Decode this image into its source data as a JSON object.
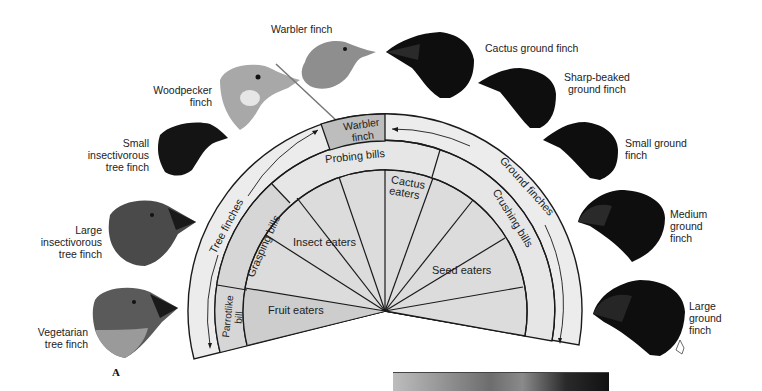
{
  "figure": {
    "panel_label": "A",
    "diagram": {
      "outer_band": {
        "left_label": "Tree finches",
        "right_label": "Ground finches",
        "center_box": "Warbler finch"
      },
      "bill_band": {
        "segments": [
          "Parrotlike bill",
          "Grasping bills",
          "Probing bills",
          "Crushing bills"
        ],
        "parrotlike_line1": "Parrotlike",
        "parrotlike_line2": "bill"
      },
      "diet_band": {
        "segments": [
          "Fruit eaters",
          "Insect eaters",
          "Cactus eaters",
          "Seed eaters"
        ],
        "cactus_line1": "Cactus",
        "cactus_line2": "eaters"
      }
    },
    "birds_left": [
      {
        "name": "Vegetarian tree finch",
        "lines": [
          "Vegetarian",
          "tree finch"
        ]
      },
      {
        "name": "Large insectivorous tree finch",
        "lines": [
          "Large",
          "insectivorous",
          "tree finch"
        ]
      },
      {
        "name": "Small insectivorous tree finch",
        "lines": [
          "Small",
          "insectivorous",
          "tree finch"
        ]
      },
      {
        "name": "Woodpecker finch",
        "lines": [
          "Woodpecker",
          "finch"
        ]
      }
    ],
    "bird_top": {
      "name": "Warbler finch",
      "lines": [
        "Warbler finch"
      ]
    },
    "birds_right": [
      {
        "name": "Cactus ground finch",
        "lines": [
          "Cactus ground finch"
        ]
      },
      {
        "name": "Sharp-beaked ground finch",
        "lines": [
          "Sharp-beaked",
          "ground finch"
        ]
      },
      {
        "name": "Small ground finch",
        "lines": [
          "Small ground",
          "finch"
        ]
      },
      {
        "name": "Medium ground finch",
        "lines": [
          "Medium",
          "ground",
          "finch"
        ]
      },
      {
        "name": "Large ground finch",
        "lines": [
          "Large",
          "ground",
          "finch"
        ]
      }
    ],
    "colors": {
      "outer_band": "#ececec",
      "bill_band": "#e4e4e4",
      "diet_fill": "#dcdcdc",
      "warbler_box": "#bdbdbd",
      "grasping_band": "#d4d4d4",
      "fruit_fill": "#cfcfcf",
      "line": "#1a1a1a",
      "dark_bird": "#111111",
      "grey_bird": "#8a8a8a"
    }
  }
}
